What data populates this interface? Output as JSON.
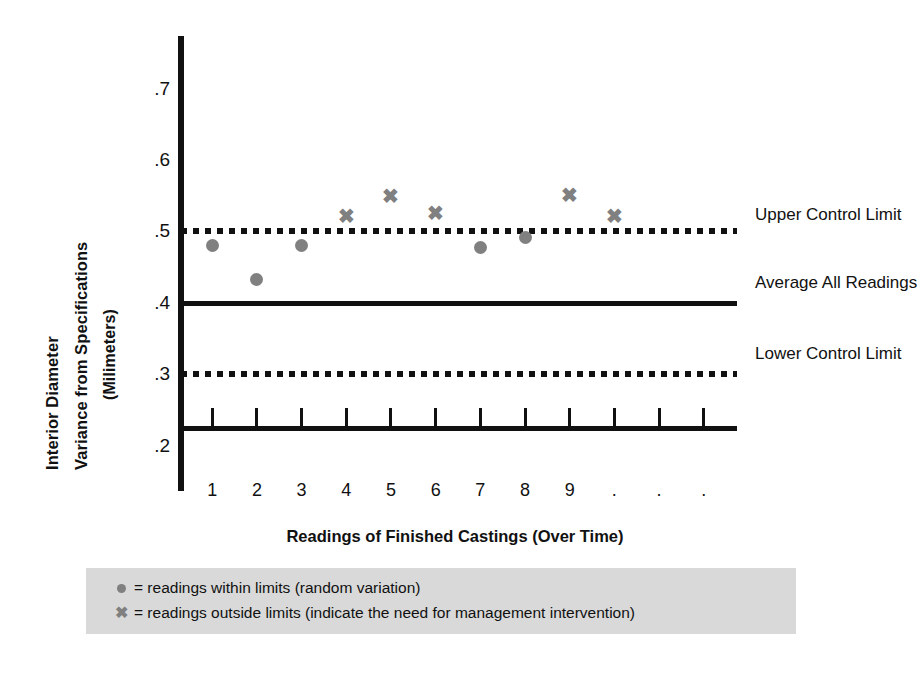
{
  "chart_data": {
    "type": "scatter",
    "title": "",
    "xlabel": "Readings of Finished Castings (Over Time)",
    "ylabel": "Interior Diameter Variance from Specifications (Milimeters)",
    "ylabel_lines": [
      "Interior Diameter",
      "Variance from Specifications",
      "(Milimeters)"
    ],
    "ylim": [
      0.15,
      0.78
    ],
    "yticks": [
      ".7",
      ".6",
      ".5",
      ".4",
      ".3",
      ".2"
    ],
    "ytick_values": [
      0.7,
      0.6,
      0.5,
      0.4,
      0.3,
      0.2
    ],
    "xticks": [
      "1",
      "2",
      "3",
      "4",
      "5",
      "6",
      "7",
      "8",
      "9",
      ".",
      ".",
      "."
    ],
    "xlim": [
      0.3,
      12.7
    ],
    "grid": false,
    "legend_position": "below-plot",
    "series": [
      {
        "name": "readings within limits (random variation)",
        "marker": "dot",
        "color": "#808080",
        "points": [
          {
            "x": 1,
            "y": 0.48
          },
          {
            "x": 2,
            "y": 0.433
          },
          {
            "x": 3,
            "y": 0.48
          },
          {
            "x": 7,
            "y": 0.477
          },
          {
            "x": 8,
            "y": 0.491
          }
        ]
      },
      {
        "name": "readings outside limits (indicate the need for management intervention)",
        "marker": "cross",
        "color": "#808080",
        "glyph": "✖",
        "points": [
          {
            "x": 4,
            "y": 0.521
          },
          {
            "x": 5,
            "y": 0.549
          },
          {
            "x": 6,
            "y": 0.526
          },
          {
            "x": 9,
            "y": 0.551
          },
          {
            "x": 10,
            "y": 0.521
          }
        ]
      }
    ],
    "reference_lines": [
      {
        "id": "ucl",
        "label": "Upper Control Limit",
        "value": 0.5,
        "style": "dotted"
      },
      {
        "id": "average",
        "label": "Average All Readings",
        "value": 0.4,
        "style": "solid"
      },
      {
        "id": "lcl",
        "label": "Lower Control Limit",
        "value": 0.3,
        "style": "dotted"
      }
    ],
    "axis_baseline_value": 0.225
  },
  "annotations": {
    "upper_control_limit": "Upper Control Limit",
    "average_all_readings": "Average All Readings",
    "lower_control_limit": "Lower Control Limit"
  },
  "legend": {
    "background": "#d9d9d9",
    "rows": [
      {
        "marker": "dot",
        "text": "= readings within limits (random variation)"
      },
      {
        "marker": "cross",
        "text": "= readings outside limits (indicate the need for management intervention)"
      }
    ]
  },
  "colors": {
    "ink": "#111111",
    "marker_gray": "#808080",
    "legend_bg": "#d9d9d9",
    "page_bg": "#ffffff"
  }
}
